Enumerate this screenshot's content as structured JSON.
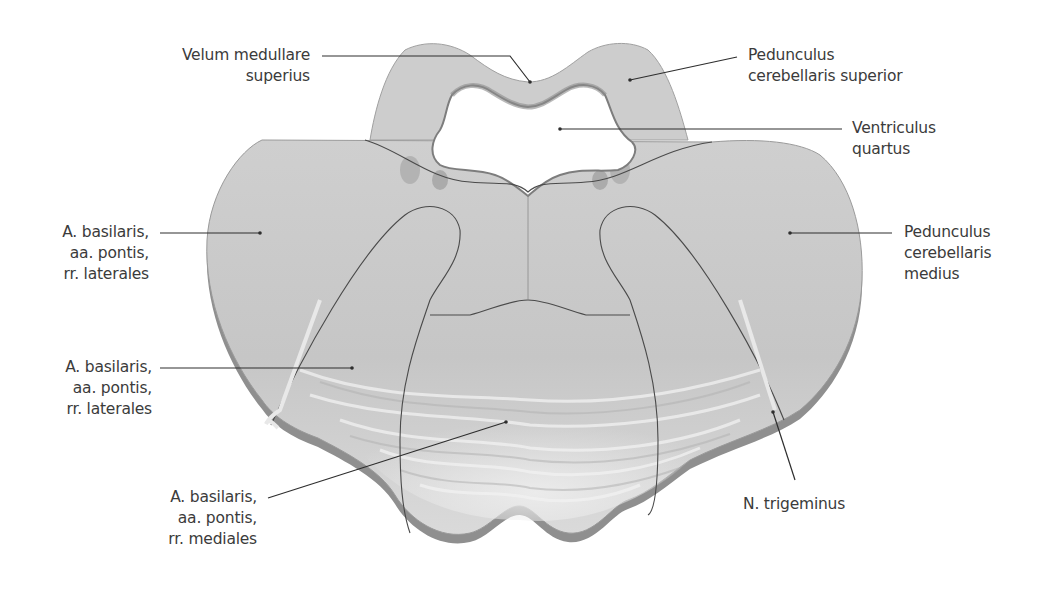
{
  "figure": {
    "colors": {
      "tissue": "#c9c9c9",
      "tissue_light": "#dedede",
      "tissue_shadow": "#8e8e8e",
      "outline": "#4a4a4a",
      "leader_line": "#2e2e2e",
      "text": "#3b3b3b",
      "background": "#ffffff"
    }
  },
  "labels": {
    "velum": {
      "lines": [
        "Velum medullare",
        "superius"
      ]
    },
    "ped_sup": {
      "lines": [
        "Pedunculus",
        "cerebellaris superior"
      ]
    },
    "ventriculus": {
      "lines": [
        "Ventriculus",
        "quartus"
      ]
    },
    "basilaris_lat_1": {
      "lines": [
        "A. basilaris,",
        "aa. pontis,",
        "rr. laterales"
      ]
    },
    "ped_med": {
      "lines": [
        "Pedunculus",
        "cerebellaris",
        "medius"
      ]
    },
    "basilaris_lat_2": {
      "lines": [
        "A. basilaris,",
        "aa. pontis,",
        "rr. laterales"
      ]
    },
    "basilaris_med": {
      "lines": [
        "A. basilaris,",
        "aa. pontis,",
        "rr. mediales"
      ]
    },
    "trigeminus": {
      "lines": [
        "N. trigeminus"
      ]
    }
  }
}
